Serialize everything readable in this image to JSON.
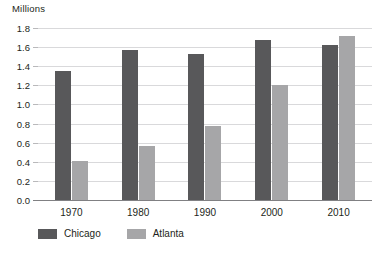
{
  "chart_data": {
    "type": "bar",
    "title": "",
    "subtitle": "",
    "ylabel": "Millions",
    "xlabel": "",
    "categories": [
      "1970",
      "1980",
      "1990",
      "2000",
      "2010"
    ],
    "series": [
      {
        "name": "Chicago",
        "color": "#58585a",
        "values": [
          1.35,
          1.57,
          1.53,
          1.67,
          1.62
        ]
      },
      {
        "name": "Atlanta",
        "color": "#a6a6a8",
        "values": [
          0.41,
          0.57,
          0.77,
          1.2,
          1.72
        ]
      }
    ],
    "ylim": [
      0.0,
      1.8
    ],
    "ytick_labels": [
      "1.8",
      "1.6",
      "1.4",
      "1.2",
      "1.0",
      "0.8",
      "0.6",
      "0.4",
      "0.2",
      "0.0"
    ],
    "ytick_values": [
      1.8,
      1.6,
      1.4,
      1.2,
      1.0,
      0.8,
      0.6,
      0.4,
      0.2,
      0.0
    ],
    "grid": true,
    "grid_color": "#d9d9db",
    "axis_color": "#808083",
    "legend_position": "bottom-left",
    "background": "#ffffff"
  },
  "legend": {
    "items": [
      {
        "label": "Chicago"
      },
      {
        "label": "Atlanta"
      }
    ]
  }
}
